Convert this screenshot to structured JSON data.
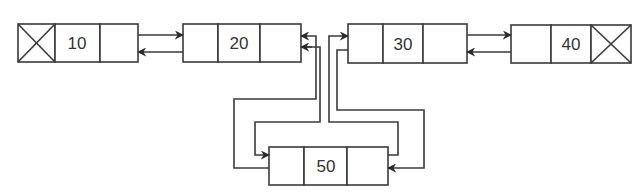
{
  "diagram": {
    "type": "doubly-linked-list",
    "colors": {
      "line": "#3a3a3a",
      "text": "#333333",
      "background": "#ffffff"
    },
    "nodes": [
      {
        "id": "n10",
        "value": "10",
        "prev_null": true,
        "next_null": false
      },
      {
        "id": "n20",
        "value": "20",
        "prev_null": false,
        "next_null": false
      },
      {
        "id": "n30",
        "value": "30",
        "prev_null": false,
        "next_null": false
      },
      {
        "id": "n40",
        "value": "40",
        "prev_null": false,
        "next_null": true
      },
      {
        "id": "n50",
        "value": "50",
        "prev_null": false,
        "next_null": false
      }
    ],
    "links": [
      {
        "from": "10",
        "to": "20",
        "kind": "next"
      },
      {
        "from": "20",
        "to": "10",
        "kind": "prev"
      },
      {
        "from": "30",
        "to": "40",
        "kind": "next"
      },
      {
        "from": "40",
        "to": "30",
        "kind": "prev"
      },
      {
        "from": "20",
        "to": "50",
        "kind": "next"
      },
      {
        "from": "50",
        "to": "20",
        "kind": "prev"
      },
      {
        "from": "50",
        "to": "30",
        "kind": "next"
      },
      {
        "from": "30",
        "to": "50",
        "kind": "prev"
      }
    ]
  }
}
